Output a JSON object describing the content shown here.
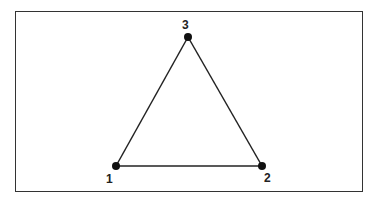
{
  "diagram": {
    "type": "graph",
    "nodes": [
      {
        "id": "1",
        "label": "1"
      },
      {
        "id": "2",
        "label": "2"
      },
      {
        "id": "3",
        "label": "3"
      }
    ],
    "edges": [
      {
        "from": "1",
        "to": "2"
      },
      {
        "from": "2",
        "to": "3"
      },
      {
        "from": "3",
        "to": "1"
      }
    ],
    "colors": {
      "stroke": "#222222",
      "node": "#111111"
    }
  }
}
